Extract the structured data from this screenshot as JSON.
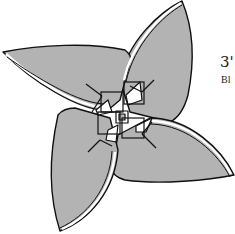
{
  "diagram": {
    "colors": {
      "petal_fill": "#b3b3b3",
      "outline": "#111111",
      "paper_white": "#ffffff",
      "background": "#ffffff"
    },
    "petals": [
      "upper-right",
      "right-lower",
      "lower-left",
      "left-upper"
    ]
  },
  "step": {
    "number": "3'",
    "caption": "Bl"
  }
}
